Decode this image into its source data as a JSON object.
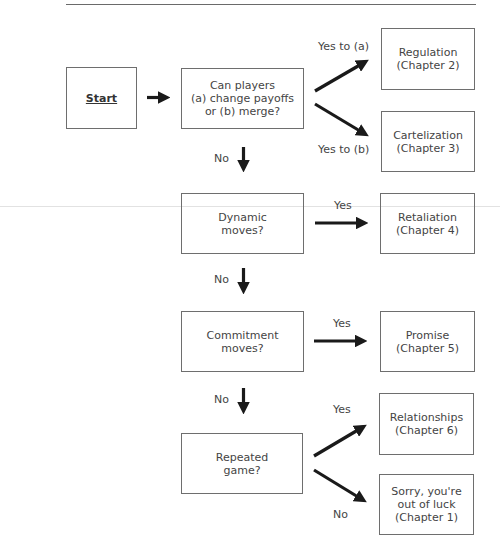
{
  "diagram": {
    "type": "flowchart",
    "nodes": {
      "start": {
        "label": "Start"
      },
      "q_payoffs": {
        "label": "Can players\n(a) change payoffs\nor (b) merge?"
      },
      "regulation": {
        "label": "Regulation\n(Chapter 2)"
      },
      "cartelization": {
        "label": "Cartelization\n(Chapter 3)"
      },
      "q_dynamic": {
        "label": "Dynamic\nmoves?"
      },
      "retaliation": {
        "label": "Retaliation\n(Chapter 4)"
      },
      "q_commitment": {
        "label": "Commitment\nmoves?"
      },
      "promise": {
        "label": "Promise\n(Chapter 5)"
      },
      "q_repeated": {
        "label": "Repeated\ngame?"
      },
      "relationships": {
        "label": "Relationships\n(Chapter 6)"
      },
      "out_of_luck": {
        "label": "Sorry, you're\nout of luck\n(Chapter 1)"
      }
    },
    "edge_labels": {
      "yes_a": "Yes to (a)",
      "yes_b": "Yes to (b)",
      "no_1": "No",
      "yes_dynamic": "Yes",
      "no_2": "No",
      "yes_commitment": "Yes",
      "no_3": "No",
      "yes_repeated": "Yes",
      "no_repeated": "No"
    },
    "edges": [
      {
        "from": "start",
        "to": "q_payoffs",
        "label": ""
      },
      {
        "from": "q_payoffs",
        "to": "regulation",
        "label": "Yes to (a)"
      },
      {
        "from": "q_payoffs",
        "to": "cartelization",
        "label": "Yes to (b)"
      },
      {
        "from": "q_payoffs",
        "to": "q_dynamic",
        "label": "No"
      },
      {
        "from": "q_dynamic",
        "to": "retaliation",
        "label": "Yes"
      },
      {
        "from": "q_dynamic",
        "to": "q_commitment",
        "label": "No"
      },
      {
        "from": "q_commitment",
        "to": "promise",
        "label": "Yes"
      },
      {
        "from": "q_commitment",
        "to": "q_repeated",
        "label": "No"
      },
      {
        "from": "q_repeated",
        "to": "relationships",
        "label": "Yes"
      },
      {
        "from": "q_repeated",
        "to": "out_of_luck",
        "label": "No"
      }
    ],
    "colors": {
      "arrow": "#1a1a1a",
      "box_border": "#6e6e6e",
      "text": "#444444"
    }
  }
}
